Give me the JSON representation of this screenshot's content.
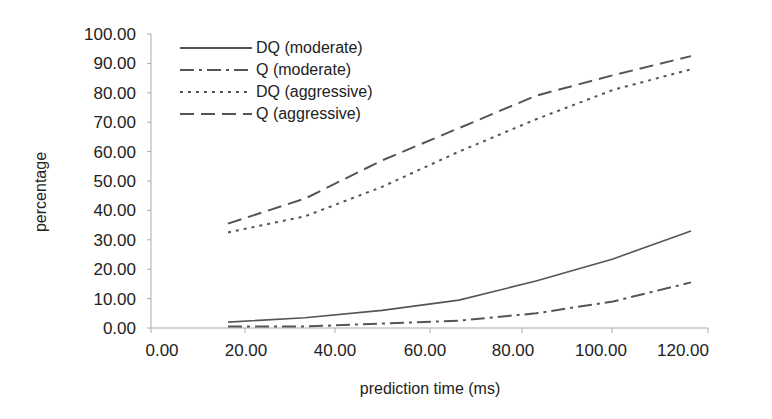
{
  "chart_data": {
    "type": "line",
    "title": "",
    "xlabel": "prediction time (ms)",
    "ylabel": "percentage",
    "x_ticks": [
      "0.00",
      "20.00",
      "40.00",
      "60.00",
      "80.00",
      "100.00",
      "120.00"
    ],
    "y_ticks": [
      "0.00",
      "10.00",
      "20.00",
      "30.00",
      "40.00",
      "50.00",
      "60.00",
      "70.00",
      "80.00",
      "90.00",
      "100.00"
    ],
    "xlim": [
      0,
      120
    ],
    "ylim": [
      0,
      100
    ],
    "grid": false,
    "legend_position": "upper-left (inside)",
    "x": [
      16.7,
      33.3,
      50.0,
      66.7,
      83.3,
      100.0,
      116.7
    ],
    "series": [
      {
        "name": "DQ (moderate)",
        "style": "solid",
        "values": [
          2.0,
          3.5,
          6.0,
          9.5,
          16.0,
          23.5,
          33.0
        ]
      },
      {
        "name": "Q (moderate)",
        "style": "dash-dot",
        "values": [
          0.5,
          0.5,
          1.5,
          2.5,
          5.0,
          9.0,
          15.5
        ]
      },
      {
        "name": "DQ (aggressive)",
        "style": "dotted",
        "values": [
          32.5,
          38.0,
          48.0,
          60.0,
          71.0,
          81.0,
          88.0
        ]
      },
      {
        "name": "Q (aggressive)",
        "style": "dashed",
        "values": [
          35.5,
          44.0,
          57.0,
          68.0,
          79.0,
          86.0,
          92.5
        ]
      }
    ]
  },
  "colors": {
    "line": "#555555",
    "text": "#222222",
    "axis": "#aaaaaa"
  }
}
